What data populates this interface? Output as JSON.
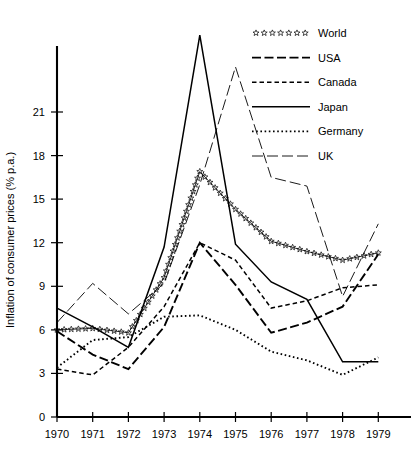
{
  "chart_data": {
    "type": "line",
    "title": "",
    "xlabel": "",
    "ylabel": "Inflation of consumer prices (% p.a.)",
    "x": [
      1970,
      1971,
      1972,
      1973,
      1974,
      1975,
      1976,
      1977,
      1978,
      1979
    ],
    "xtick_labels": [
      "1970",
      "1971",
      "1972",
      "1973",
      "1974",
      "1975",
      "1976",
      "1977",
      "1978",
      "1979"
    ],
    "ytick_labels": [
      "0",
      "3",
      "6",
      "9",
      "12",
      "15",
      "18",
      "21"
    ],
    "ytick_values": [
      0,
      3,
      6,
      9,
      12,
      15,
      18,
      21
    ],
    "ylim": [
      0,
      23.8
    ],
    "xlim": [
      1970,
      1979.6
    ],
    "grid": false,
    "legend_position": "top-right",
    "series": [
      {
        "name": "World",
        "marker": "star",
        "style": "stars",
        "values": [
          6.0,
          6.1,
          5.8,
          9.6,
          16.9,
          14.3,
          12.1,
          11.4,
          10.8,
          11.3
        ]
      },
      {
        "name": "USA",
        "style": "long-dash",
        "values": [
          5.9,
          4.3,
          3.3,
          6.2,
          12.0,
          9.1,
          5.8,
          6.5,
          7.6,
          11.2
        ]
      },
      {
        "name": "Canada",
        "style": "short-dash",
        "values": [
          3.3,
          2.9,
          4.8,
          7.6,
          12.0,
          10.8,
          7.5,
          8.0,
          8.9,
          9.1
        ]
      },
      {
        "name": "Japan",
        "style": "solid",
        "values": [
          7.5,
          6.2,
          4.8,
          11.7,
          26.3,
          11.9,
          9.3,
          8.1,
          3.8,
          3.8
        ]
      },
      {
        "name": "Germany",
        "style": "dotted",
        "values": [
          3.4,
          5.3,
          5.5,
          6.9,
          7.0,
          6.0,
          4.5,
          3.9,
          2.9,
          4.1
        ]
      },
      {
        "name": "UK",
        "style": "dash-dot-long",
        "values": [
          6.5,
          9.2,
          7.1,
          9.2,
          16.0,
          24.1,
          16.5,
          15.9,
          8.3,
          13.3
        ]
      }
    ]
  },
  "legend": {
    "items": [
      {
        "label": "World",
        "style": "stars"
      },
      {
        "label": "USA",
        "style": "long-dash"
      },
      {
        "label": "Canada",
        "style": "short-dash"
      },
      {
        "label": "Japan",
        "style": "solid"
      },
      {
        "label": "Germany",
        "style": "dotted"
      },
      {
        "label": "UK",
        "style": "dash-dot-long"
      }
    ]
  },
  "colors": {
    "ink": "#000000",
    "background": "#ffffff"
  }
}
